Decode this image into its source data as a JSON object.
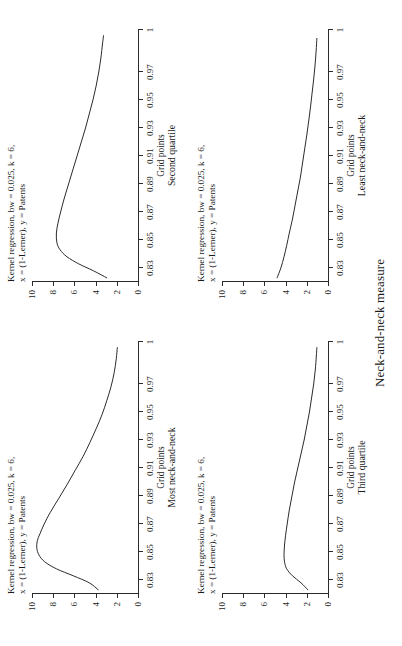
{
  "figure": {
    "xlabel": "Neck-and-neck measure",
    "header_line1": "Kernel regression, bw = 0.025, k = 6,",
    "header_line2": "x = (1-Lerner), y = Patents",
    "axis_title": "Grid points",
    "line_color": "#2b2b2b"
  },
  "axes": {
    "x_ticks": [
      "0.83",
      "0.85",
      "0.87",
      "0.89",
      "0.91",
      "0.93",
      "0.95",
      "0.97",
      "1"
    ],
    "x_tick_values": [
      0.83,
      0.85,
      0.87,
      0.89,
      0.91,
      0.93,
      0.95,
      0.97,
      1.0
    ],
    "y_ticks": [
      "0",
      "2",
      "4",
      "6",
      "8",
      "10"
    ],
    "y_tick_values": [
      0,
      2,
      4,
      6,
      8,
      10
    ],
    "xlim": [
      0.82,
      1.0
    ],
    "ylim": [
      0,
      10
    ]
  },
  "panels": [
    {
      "caption": "Most neck-and-neck",
      "header_line1": "Kernel regression, bw = 0.025, k = 6,",
      "header_line2": "x = (1-Lerner), y = Patents",
      "axis_title": "Grid points"
    },
    {
      "caption": "Second quartile",
      "header_line1": "Kernel regression, bw = 0.025, k = 6,",
      "header_line2": "x = (1-Lerner), y = Patents",
      "axis_title": "Grid points"
    },
    {
      "caption": "Third quartile",
      "header_line1": "Kernel regression, bw = 0.025, k = 6,",
      "header_line2": "x = (1-Lerner), y = Patents",
      "axis_title": "Grid points"
    },
    {
      "caption": "Least neck-and-neck",
      "header_line1": "Kernel regression, bw = 0.025, k = 6,",
      "header_line2": "x = (1-Lerner), y = Patents",
      "axis_title": "Grid points"
    }
  ],
  "chart_data": [
    {
      "type": "line",
      "title": "Most neck-and-neck",
      "subtitle": "Kernel regression, bw = 0.025, k = 6, x = (1-Lerner), y = Patents",
      "xlabel": "Grid points",
      "ylabel": "Patents",
      "xlim": [
        0.82,
        1.0
      ],
      "ylim": [
        0,
        10
      ],
      "grid": false,
      "legend": "none",
      "x": [
        0.823,
        0.828,
        0.833,
        0.838,
        0.843,
        0.848,
        0.853,
        0.858,
        0.863,
        0.87,
        0.878,
        0.888,
        0.898,
        0.908,
        0.918,
        0.928,
        0.938,
        0.948,
        0.958,
        0.968,
        0.978,
        0.988,
        0.996
      ],
      "y": [
        3.75,
        4.6,
        6.1,
        7.7,
        8.8,
        9.35,
        9.55,
        9.5,
        9.25,
        8.85,
        8.3,
        7.5,
        6.7,
        5.95,
        5.2,
        4.55,
        3.95,
        3.4,
        2.95,
        2.55,
        2.25,
        2.05,
        1.95
      ]
    },
    {
      "type": "line",
      "title": "Second quartile",
      "subtitle": "Kernel regression, bw = 0.025, k = 6, x = (1-Lerner), y = Patents",
      "xlabel": "Grid points",
      "ylabel": "Patents",
      "xlim": [
        0.82,
        1.0
      ],
      "ylim": [
        0,
        10
      ],
      "grid": false,
      "legend": "none",
      "x": [
        0.823,
        0.828,
        0.833,
        0.838,
        0.843,
        0.848,
        0.855,
        0.862,
        0.87,
        0.88,
        0.89,
        0.9,
        0.91,
        0.92,
        0.93,
        0.94,
        0.95,
        0.96,
        0.97,
        0.98,
        0.99,
        0.996
      ],
      "y": [
        2.95,
        4.2,
        5.6,
        6.7,
        7.35,
        7.65,
        7.7,
        7.55,
        7.3,
        6.95,
        6.55,
        6.15,
        5.75,
        5.35,
        4.95,
        4.6,
        4.25,
        3.95,
        3.7,
        3.5,
        3.35,
        3.25
      ]
    },
    {
      "type": "line",
      "title": "Third quartile",
      "subtitle": "Kernel regression, bw = 0.025, k = 6, x = (1-Lerner), y = Patents",
      "xlabel": "Grid points",
      "ylabel": "Patents",
      "xlim": [
        0.82,
        1.0
      ],
      "ylim": [
        0,
        10
      ],
      "grid": false,
      "legend": "none",
      "x": [
        0.823,
        0.828,
        0.833,
        0.838,
        0.843,
        0.848,
        0.855,
        0.862,
        0.87,
        0.88,
        0.89,
        0.9,
        0.91,
        0.92,
        0.93,
        0.94,
        0.95,
        0.96,
        0.97,
        0.98,
        0.99,
        0.996
      ],
      "y": [
        1.9,
        2.55,
        3.35,
        3.9,
        4.1,
        4.15,
        4.1,
        4.0,
        3.85,
        3.65,
        3.4,
        3.15,
        2.85,
        2.55,
        2.25,
        2.0,
        1.75,
        1.55,
        1.35,
        1.2,
        1.1,
        1.05
      ]
    },
    {
      "type": "line",
      "title": "Least neck-and-neck",
      "subtitle": "Kernel regression, bw = 0.025, k = 6, x = (1-Lerner), y = Patents",
      "xlabel": "Grid points",
      "ylabel": "Patents",
      "xlim": [
        0.82,
        1.0
      ],
      "ylim": [
        0,
        10
      ],
      "grid": false,
      "legend": "none",
      "x": [
        0.823,
        0.83,
        0.838,
        0.846,
        0.855,
        0.865,
        0.875,
        0.885,
        0.895,
        0.905,
        0.915,
        0.925,
        0.935,
        0.945,
        0.955,
        0.965,
        0.975,
        0.985,
        0.994
      ],
      "y": [
        4.8,
        4.45,
        4.15,
        3.9,
        3.65,
        3.35,
        3.1,
        2.85,
        2.6,
        2.4,
        2.2,
        2.0,
        1.82,
        1.65,
        1.5,
        1.35,
        1.22,
        1.12,
        1.05
      ]
    }
  ]
}
